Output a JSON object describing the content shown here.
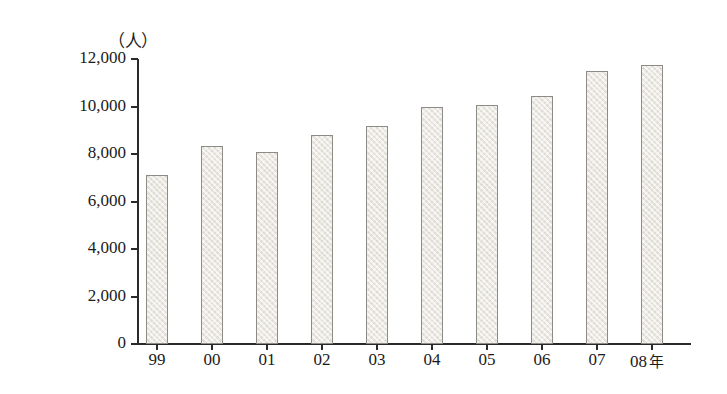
{
  "chart_data": {
    "type": "bar",
    "title": "",
    "subtitle": "",
    "xlabel": "",
    "ylabel": "",
    "unit_label": "（人）",
    "x_axis_suffix": "年",
    "categories": [
      "99",
      "00",
      "01",
      "02",
      "03",
      "04",
      "05",
      "06",
      "07",
      "08"
    ],
    "values": [
      7100,
      8350,
      8100,
      8800,
      9200,
      10000,
      10050,
      10450,
      11500,
      11750
    ],
    "ylim": [
      0,
      12000
    ],
    "ytick_values": [
      0,
      2000,
      4000,
      6000,
      8000,
      10000,
      12000
    ],
    "ytick_labels": [
      "0",
      "2,000",
      "4,000",
      "6,000",
      "8,000",
      "10,000",
      "12,000"
    ],
    "grid": false,
    "legend": false,
    "legend_position": "none",
    "annotations": []
  },
  "style": {
    "background_color": "#ffffff",
    "axis_color": "#2a2a2a",
    "text_color": "#1b1b1b",
    "bar_fill_color": "#e9e5dd",
    "bar_border_color": "#8d8b85"
  },
  "geometry": {
    "plot_left": 137,
    "plot_right": 691,
    "plot_top": 59,
    "baseline_y": 344,
    "bar_width": 22,
    "bar_pitch": 55,
    "first_bar_left": 146
  }
}
